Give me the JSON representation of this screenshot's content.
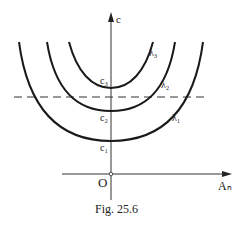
{
  "figure": {
    "caption": "Fig. 25.6",
    "axes": {
      "y_label": "c",
      "x_label": "Aₙ",
      "origin_label": "O"
    },
    "curves": [
      {
        "name": "λ₁",
        "min_label": "c₁"
      },
      {
        "name": "λ₂",
        "min_label": "c₂"
      },
      {
        "name": "λ₃",
        "min_label": "c₃"
      }
    ],
    "dashed_line": "horizontal reference level",
    "colors": {
      "ink": "#222222",
      "background": "#ffffff"
    }
  }
}
